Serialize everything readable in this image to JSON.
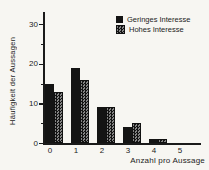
{
  "figure": {
    "paper_color": "#f7f6f2",
    "ink_color": "#1a1a1a",
    "checker_light_color": "#848484"
  },
  "chart_data": {
    "type": "bar",
    "title": "",
    "categories": [
      "0",
      "1",
      "2",
      "3",
      "4",
      "5"
    ],
    "series": [
      {
        "name": "Geringes Interesse",
        "pattern": "solid",
        "color": "#141414",
        "values": [
          15,
          19,
          9,
          4,
          1,
          0
        ]
      },
      {
        "name": "Hohes Interesse",
        "pattern": "checker",
        "color": "#141414",
        "values": [
          13,
          16,
          9,
          5,
          1,
          0
        ]
      }
    ],
    "xlabel": "Anzahl pro Aussage",
    "ylabel": "Häufigkeit der Aussagen",
    "ylim": [
      0,
      33
    ],
    "yticks": [
      0,
      10,
      20,
      30
    ],
    "yminorticks": [
      5,
      15,
      25
    ],
    "grid": false,
    "legend_position": "top-right"
  }
}
